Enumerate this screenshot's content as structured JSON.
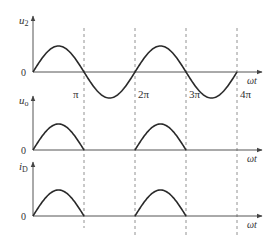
{
  "diagram": {
    "type": "waveform",
    "colors": {
      "curve": "#2a2a2a",
      "axis": "#555555",
      "dashed": "#777777",
      "text": "#333333",
      "background": "#ffffff"
    },
    "dashed_marks": [
      {
        "label": "π",
        "x": 84
      },
      {
        "label": "2π",
        "x": 135
      },
      {
        "label": "3π",
        "x": 186
      },
      {
        "label": "4π",
        "x": 237
      }
    ],
    "plots": [
      {
        "id": "u2",
        "y_label": "u",
        "y_label_sub": "2",
        "origin_label": "0",
        "x_label": "ωt",
        "baseline_y": 72,
        "axis_top_y": 16,
        "waveform": "full-sine",
        "amplitude_px": 26,
        "periods": 2
      },
      {
        "id": "uo",
        "y_label": "u",
        "y_label_sub": "o",
        "origin_label": "0",
        "x_label": "ωt",
        "baseline_y": 150,
        "axis_top_y": 96,
        "waveform": "half-wave-rectified",
        "amplitude_px": 26,
        "periods": 2
      },
      {
        "id": "iD",
        "y_label": "i",
        "y_label_sub": "D",
        "origin_label": "0",
        "x_label": "ωt",
        "baseline_y": 216,
        "axis_top_y": 162,
        "waveform": "half-wave-rectified",
        "amplitude_px": 26,
        "periods": 2
      }
    ]
  }
}
